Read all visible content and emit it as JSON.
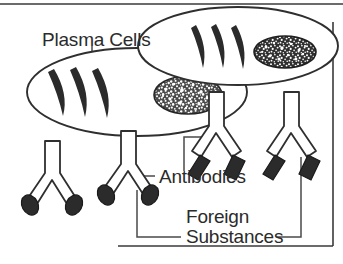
{
  "figure": {
    "background_color": "#ffffff",
    "ink_color": "#2b2b2b",
    "frame": {
      "present": true,
      "sides": [
        "top",
        "right",
        "bottom"
      ],
      "stroke_color": "#3a3a3a"
    }
  },
  "labels": {
    "plasma_cells": "Plasma Cells",
    "antibodies": "Antibodies",
    "foreign_substances_line1": "Foreign",
    "foreign_substances_line2": "Substances"
  },
  "legend_semantics": {
    "plasma_cell": "large ellipse with three crescent endoplasmic-reticulum arcs and a stippled nucleus",
    "antibody": "Y-shaped molecule drawn as an outlined stem splitting into two arms",
    "foreign_substance_oval": "solid dark oval bound to antibody arm tips",
    "foreign_substance_diamond": "solid dark rhomboid bound to antibody arm tips"
  },
  "elements": {
    "plasma_cells": [
      {
        "name": "plasma-cell-left",
        "cx": 137,
        "cy": 92,
        "rx": 110,
        "ry": 44,
        "nucleus_cx": 188,
        "nucleus_cy": 95,
        "nucleus_rx": 34,
        "nucleus_ry": 19,
        "nucleus_style": "stippled-light",
        "er_arcs": 3
      },
      {
        "name": "plasma-cell-upper-right",
        "cx": 238,
        "cy": 46,
        "rx": 100,
        "ry": 39,
        "nucleus_cx": 285,
        "nucleus_cy": 52,
        "nucleus_rx": 31,
        "nucleus_ry": 16,
        "nucleus_style": "stippled-dark",
        "er_arcs": 3
      }
    ],
    "antibodies": [
      {
        "name": "antibody-1",
        "stem_x": 52,
        "stem_top_y": 141,
        "tip_shape": "oval",
        "bound": true
      },
      {
        "name": "antibody-2",
        "stem_x": 128,
        "stem_top_y": 131,
        "tip_shape": "oval",
        "bound": true
      },
      {
        "name": "antibody-3",
        "stem_x": 216,
        "stem_top_y": 92,
        "tip_shape": "diamond",
        "bound": true
      },
      {
        "name": "antibody-4",
        "stem_x": 291,
        "stem_top_y": 92,
        "tip_shape": "diamond",
        "bound": true
      }
    ],
    "counts": {
      "plasma_cells": 2,
      "antibodies": 4,
      "foreign_substances_oval": 4,
      "foreign_substances_diamond": 4
    }
  },
  "leader_lines": [
    {
      "name": "leader-plasma-cells-to-upper-right-cell",
      "from_label": "plasma_cells",
      "to": "plasma-cell-upper-right"
    },
    {
      "name": "leader-plasma-cells-to-left-cell",
      "from_label": "plasma_cells",
      "to": "plasma-cell-left"
    },
    {
      "name": "leader-antibodies-to-antibody-2",
      "from_label": "antibodies",
      "to": "antibody-2"
    },
    {
      "name": "leader-antibodies-to-antibody-3",
      "from_label": "antibodies",
      "to": "antibody-3"
    },
    {
      "name": "leader-foreign-substances-to-antibody-2-tip",
      "from_label": "foreign_substances",
      "to": "antibody-2-oval"
    },
    {
      "name": "leader-foreign-substances-to-antibody-4-tip",
      "from_label": "foreign_substances",
      "to": "antibody-4-diamond"
    }
  ]
}
